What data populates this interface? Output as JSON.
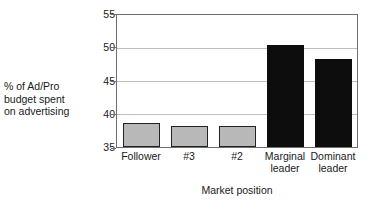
{
  "chart_data": {
    "type": "bar",
    "title": "",
    "xlabel": "Market position",
    "ylabel": "% of Ad/Pro\nbudget spent\non advertising",
    "categories": [
      "Follower",
      "#3",
      "#2",
      "Marginal\nleader",
      "Dominant\nleader"
    ],
    "values": [
      38.6,
      38.2,
      38.2,
      50.5,
      48.4
    ],
    "ylim": [
      35,
      55
    ],
    "yticks": [
      "35",
      "40",
      "45",
      "50",
      "55"
    ],
    "grid": true,
    "legend": "none",
    "bar_colors": [
      "#b8b8b8",
      "#b8b8b8",
      "#b8b8b8",
      "#0d0d0d",
      "#0d0d0d"
    ],
    "bar_border": "#222222",
    "gridline_color": "#bdbdbd",
    "frame_color": "#6e6e6e"
  }
}
